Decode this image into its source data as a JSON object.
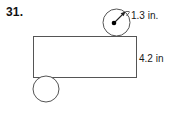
{
  "figure": {
    "problem_number": "31.",
    "labels": {
      "radius": "1.3 in.",
      "height": "4.2 in"
    },
    "colors": {
      "stroke": "#555555",
      "text": "#1a1a1a",
      "background": "#ffffff",
      "dot": "#000000"
    },
    "shapes": {
      "rectangle": {
        "x": 33,
        "y": 36,
        "width": 103,
        "height": 41
      },
      "top_circle": {
        "cx": 116.5,
        "cy": 22.5,
        "r": 13.5
      },
      "bottom_circle": {
        "cx": 46,
        "cy": 89,
        "r": 13
      },
      "radius_arrow": {
        "from_x": 114,
        "from_y": 23,
        "to_x": 125,
        "to_y": 12
      },
      "center_dot": {
        "cx": 114,
        "cy": 23,
        "r": 2.2
      }
    }
  }
}
